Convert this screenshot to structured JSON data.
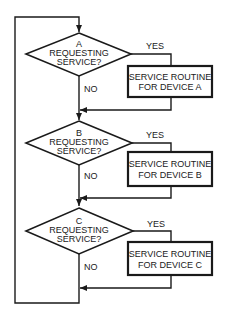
{
  "diagram": {
    "type": "flowchart",
    "title": "",
    "decisions": [
      {
        "device": "A",
        "line2": "REQUESTING",
        "line3": "SERVICE?",
        "yes_label": "YES",
        "no_label": "NO",
        "routine_line1": "SERVICE ROUTINE",
        "routine_line2": "FOR DEVICE A"
      },
      {
        "device": "B",
        "line2": "REQUESTING",
        "line3": "SERVICE?",
        "yes_label": "YES",
        "no_label": "NO",
        "routine_line1": "SERVICE ROUTINE",
        "routine_line2": "FOR DEVICE B"
      },
      {
        "device": "C",
        "line2": "REQUESTING",
        "line3": "SERVICE?",
        "yes_label": "YES",
        "no_label": "NO",
        "routine_line1": "SERVICE ROUTINE",
        "routine_line2": "FOR DEVICE C"
      }
    ],
    "colors": {
      "line": "#1a1a1a",
      "background": "#ffffff"
    }
  }
}
